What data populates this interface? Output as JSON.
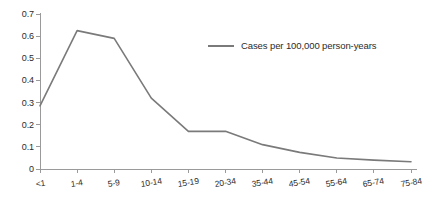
{
  "chart_data": {
    "type": "line",
    "title": "",
    "subtitle": "",
    "xlabel": "",
    "ylabel": "",
    "categories": [
      "<1",
      "1-4",
      "5-9",
      "10-14",
      "15-19",
      "20-34",
      "35-44",
      "45-54",
      "55-64",
      "65-74",
      "75-84"
    ],
    "series": [
      {
        "name": "Cases per 100,000 person-years",
        "color": "#7a7a7a",
        "values": [
          0.285,
          0.625,
          0.59,
          0.32,
          0.17,
          0.17,
          0.11,
          0.075,
          0.05,
          0.04,
          0.033
        ]
      }
    ],
    "ylim": [
      0,
      0.7
    ],
    "yticks": [
      "0",
      "0.1",
      "0.2",
      "0.3",
      "0.4",
      "0.5",
      "0.6",
      "0.7"
    ],
    "ytick_values": [
      0,
      0.1,
      0.2,
      0.3,
      0.4,
      0.5,
      0.6,
      0.7
    ],
    "grid": false,
    "legend": {
      "position": "inside-upper-right",
      "entries": [
        {
          "label": "Cases per 100,000 person-years",
          "color": "#7a7a7a"
        }
      ]
    },
    "axis_color": "#9a9a9a",
    "text_color": "#2b2b2b"
  }
}
